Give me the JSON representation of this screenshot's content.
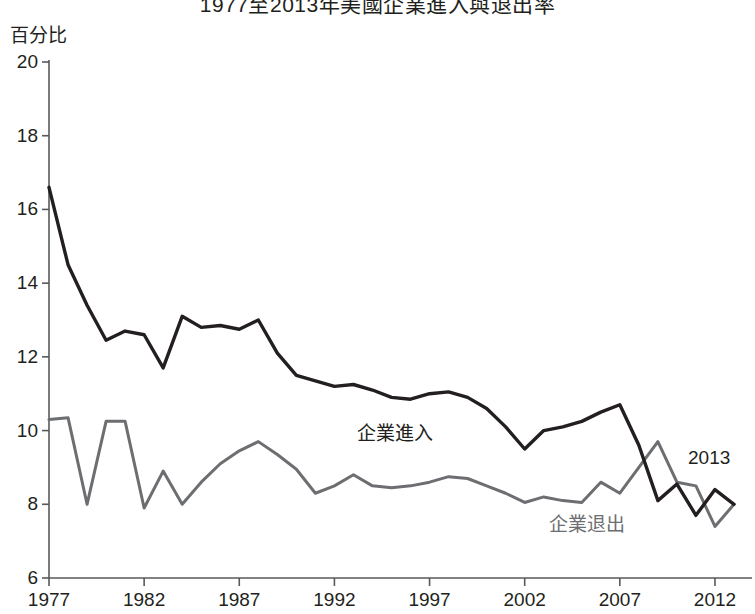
{
  "chart_data": {
    "type": "line",
    "title": "1977至2013年美國企業進入與退出率",
    "ylabel": "百分比",
    "xlabel": "",
    "xlim": [
      1977,
      2013
    ],
    "ylim": [
      6,
      20
    ],
    "yticks": [
      6,
      8,
      10,
      12,
      14,
      16,
      18,
      20
    ],
    "xticks": [
      1977,
      1982,
      1987,
      1992,
      1997,
      2002,
      2007,
      2012
    ],
    "grid": false,
    "legend_position": "inline-annotations",
    "annotations": [
      {
        "text": "2013",
        "x": 2013,
        "y": 9.0
      }
    ],
    "x": [
      1977,
      1978,
      1979,
      1980,
      1981,
      1982,
      1983,
      1984,
      1985,
      1986,
      1987,
      1988,
      1989,
      1990,
      1991,
      1992,
      1993,
      1994,
      1995,
      1996,
      1997,
      1998,
      1999,
      2000,
      2001,
      2002,
      2003,
      2004,
      2005,
      2006,
      2007,
      2008,
      2009,
      2010,
      2011,
      2012,
      2013
    ],
    "series": [
      {
        "name": "企業進入",
        "color": "#231f20",
        "values": [
          16.6,
          14.5,
          13.4,
          12.45,
          12.7,
          12.6,
          11.7,
          13.1,
          12.8,
          12.85,
          12.75,
          13.0,
          12.1,
          11.5,
          11.35,
          11.2,
          11.25,
          11.1,
          10.9,
          10.85,
          11.0,
          11.05,
          10.9,
          10.6,
          10.1,
          9.5,
          10.0,
          10.1,
          10.25,
          10.5,
          10.7,
          9.6,
          8.1,
          8.55,
          7.7,
          8.4,
          8.0
        ]
      },
      {
        "name": "企業退出",
        "color": "#6d6e71",
        "values": [
          10.3,
          10.35,
          8.0,
          10.25,
          10.25,
          7.9,
          8.9,
          8.0,
          8.6,
          9.1,
          9.45,
          9.7,
          9.35,
          8.95,
          8.3,
          8.5,
          8.8,
          8.5,
          8.45,
          8.5,
          8.6,
          8.75,
          8.7,
          8.5,
          8.3,
          8.05,
          8.2,
          8.1,
          8.05,
          8.6,
          8.3,
          9.0,
          9.7,
          8.6,
          8.5,
          7.4,
          8.0
        ]
      }
    ]
  },
  "labels": {
    "series_entry": "企業進入",
    "series_exit": "企業退出",
    "annotation_2013": "2013"
  }
}
